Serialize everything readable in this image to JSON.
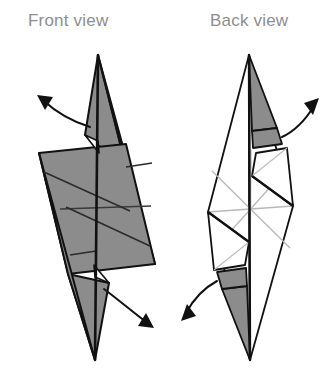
{
  "figure": {
    "kind": "origami-fold-diagram",
    "background_color": "#ffffff",
    "width": 326,
    "height": 390
  },
  "labels": {
    "front_view": "Front view",
    "back_view": "Back view",
    "label_color": "#8e8e8e",
    "label_font_size": 17
  },
  "colors": {
    "paper_front": "#8c8c8c",
    "paper_back": "#ffffff",
    "outline": "#111111",
    "crease_strong": "#111111",
    "crease_light": "#b8b8b8",
    "arrow": "#111111"
  },
  "panels": [
    {
      "id": "front-view-panel",
      "label": "Front view",
      "label_x": 28,
      "label_y": 26,
      "description": "Gray (colored side) elongated kite body with parallelogram middle, two long spikes, and two curved fold arrows",
      "fill_mode": "gray",
      "apex_top": [
        98,
        55
      ],
      "apex_bottom": [
        95,
        360
      ],
      "shapes": [
        {
          "name": "upper-spike",
          "fill": "#8c8c8c",
          "stroke": "#111111",
          "points": "98,55 126,167 85,135"
        },
        {
          "name": "upper-right-wedge",
          "fill": "#8c8c8c",
          "stroke": "#111111",
          "points": "98,55 155,264 126,167"
        },
        {
          "name": "body-parallelogram",
          "fill": "#8c8c8c",
          "stroke": "#111111",
          "points": "39,153 126,144 155,264 68,274"
        },
        {
          "name": "lower-spike",
          "fill": "#8c8c8c",
          "stroke": "#111111",
          "points": "95,360 68,274 109,283"
        },
        {
          "name": "lower-left-wedge",
          "fill": "#8c8c8c",
          "stroke": "#111111",
          "points": "95,360 39,153 68,274"
        }
      ],
      "creases": [
        {
          "name": "center-vertical",
          "weight": "strong",
          "path": "M98,55 L95,360"
        },
        {
          "name": "mid-horizontal",
          "weight": "medium",
          "path": "M60,209 L151,206"
        },
        {
          "name": "upper-diagonal",
          "weight": "medium",
          "path": "M44,172 L130,211"
        },
        {
          "name": "lower-diagonal",
          "weight": "medium",
          "path": "M66,207 L150,246"
        },
        {
          "name": "upper-short-crease",
          "weight": "medium",
          "path": "M126,167 L151,163"
        },
        {
          "name": "lower-short-crease",
          "weight": "medium",
          "path": "M70,254 L96,250"
        }
      ],
      "notches": [
        {
          "name": "top-notch",
          "points": "85,135 96,140 98,152"
        },
        {
          "name": "bottom-notch",
          "points": "109,283 97,278 95,266"
        }
      ],
      "arrows": [
        {
          "name": "upper-fold-arrow",
          "direction": "up-left",
          "path": "M90,127 C72,121 56,112 42,100",
          "head": "38,97 52,98 47,110"
        },
        {
          "name": "lower-fold-arrow",
          "direction": "down-right",
          "path": "M104,289 C119,300 133,312 146,322",
          "head": "152,326 139,325 144,313"
        }
      ]
    },
    {
      "id": "back-view-panel",
      "label": "Back view",
      "label_x": 210,
      "label_y": 26,
      "description": "White (back side) version of same model showing light gray crease star at center, two small gray flaps at top and bottom, and two curved fold arrows",
      "fill_mode": "white",
      "apex_top": [
        249,
        55
      ],
      "apex_bottom": [
        250,
        360
      ],
      "shapes": [
        {
          "name": "top-gray-triangle",
          "fill": "#8c8c8c",
          "stroke": "#111111",
          "points": "249,55 251,130 276,127"
        },
        {
          "name": "top-gray-strip",
          "fill": "#8c8c8c",
          "stroke": "#111111",
          "points": "251,130 276,127 281,143 252,147"
        },
        {
          "name": "bottom-gray-triangle",
          "fill": "#8c8c8c",
          "stroke": "#111111",
          "points": "250,360 248,287 223,290"
        },
        {
          "name": "bottom-gray-strip",
          "fill": "#8c8c8c",
          "stroke": "#111111",
          "points": "248,287 223,290 218,273 247,269"
        },
        {
          "name": "left-outer-body",
          "fill": "#ffffff",
          "stroke": "#111111",
          "points": "249,55 208,212 250,360"
        },
        {
          "name": "right-outer-body",
          "fill": "#ffffff",
          "stroke": "#111111",
          "points": "249,55 293,206 250,360"
        },
        {
          "name": "upper-right-flap",
          "fill": "#ffffff",
          "stroke": "#111111",
          "points": "256,153 286,148 293,206 252,176"
        },
        {
          "name": "lower-left-flap",
          "fill": "#ffffff",
          "stroke": "#111111",
          "points": "245,265 214,270 208,212 249,242"
        }
      ],
      "creases": [
        {
          "name": "center-vertical",
          "weight": "strong",
          "path": "M249,55 L250,360"
        },
        {
          "name": "star-horizontal",
          "weight": "light",
          "path": "M208,212 L293,206"
        },
        {
          "name": "star-diag-a",
          "weight": "light",
          "path": "M212,171 L290,248"
        },
        {
          "name": "star-diag-b",
          "weight": "light",
          "path": "M212,252 L290,165"
        },
        {
          "name": "upper-strong-diagonal",
          "weight": "strong",
          "path": "M252,176 L293,206"
        },
        {
          "name": "lower-strong-diagonal",
          "weight": "strong",
          "path": "M249,242 L208,212"
        },
        {
          "name": "upper-flap-fold",
          "weight": "strong",
          "path": "M256,153 L252,176"
        },
        {
          "name": "lower-flap-fold",
          "weight": "strong",
          "path": "M245,265 L249,242"
        },
        {
          "name": "upper-flap-thin",
          "weight": "light",
          "path": "M286,148 L252,176"
        },
        {
          "name": "lower-flap-thin",
          "weight": "light",
          "path": "M214,270 L249,242"
        }
      ],
      "arrows": [
        {
          "name": "upper-fold-arrow",
          "direction": "up-right",
          "path": "M281,136 C294,130 306,118 314,105",
          "head": "318,100 305,104 312,115"
        },
        {
          "name": "lower-fold-arrow",
          "direction": "down-left",
          "path": "M218,281 C205,288 194,300 187,313",
          "head": "183,319 196,314 189,304"
        }
      ]
    }
  ]
}
